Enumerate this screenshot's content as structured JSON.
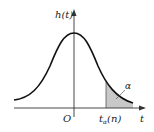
{
  "figure": {
    "type": "probability-density-diagram",
    "y_axis_label": "h(t)",
    "x_axis_label": "t",
    "origin_label": "O",
    "critical_value_label_main": "t",
    "critical_value_label_sub": "α",
    "critical_value_label_arg": "(n)",
    "tail_area_label": "α",
    "colors": {
      "curve": "#111111",
      "axes": "#333333",
      "shaded_region": "#c8c8c8",
      "background": "#ffffff"
    }
  }
}
